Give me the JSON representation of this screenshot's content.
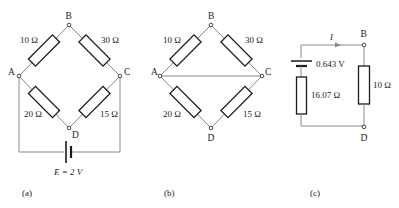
{
  "figure": {
    "panels": [
      {
        "id": "a",
        "label": "(a)",
        "nodes": {
          "A": "A",
          "B": "B",
          "C": "C",
          "D": "D"
        },
        "resistors": {
          "AB": "10 Ω",
          "BC": "30 Ω",
          "AD": "20 Ω",
          "DC": "15 Ω"
        },
        "source": {
          "label": "E = 2 V"
        }
      },
      {
        "id": "b",
        "label": "(b)",
        "nodes": {
          "A": "A",
          "B": "B",
          "C": "C",
          "D": "D"
        },
        "resistors": {
          "AB": "10 Ω",
          "BC": "30 Ω",
          "AD": "20 Ω",
          "DC": "15 Ω"
        }
      },
      {
        "id": "c",
        "label": "(c)",
        "nodes": {
          "B": "B",
          "D": "D"
        },
        "current_label": "I",
        "source": {
          "label": "0.643 V"
        },
        "resistors": {
          "internal": "16.07 Ω",
          "load": "10 Ω"
        }
      }
    ],
    "caption": ""
  }
}
